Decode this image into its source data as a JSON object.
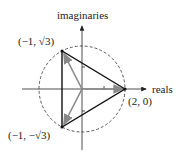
{
  "diagram": {
    "type": "complex-plane-cube-roots",
    "axes": {
      "x_label": "reals",
      "y_label": "imaginaries"
    },
    "circle": {
      "center": [
        0,
        0
      ],
      "radius": 2,
      "style": "dashed"
    },
    "points": [
      {
        "label": "(2, 0)",
        "re": 2,
        "im": 0
      },
      {
        "label": "(−1, √3)",
        "re": -1,
        "im": 1.732
      },
      {
        "label": "(−1, −√3)",
        "re": -1,
        "im": -1.732
      }
    ],
    "triangle": {
      "color": "#111111"
    },
    "vectors": {
      "color": "#888888"
    }
  },
  "labels": {
    "imaginaries": "imaginaries",
    "reals": "reals",
    "p1": "(2, 0)",
    "p2": "(−1, √3)",
    "p3": "(−1, −√3)"
  }
}
